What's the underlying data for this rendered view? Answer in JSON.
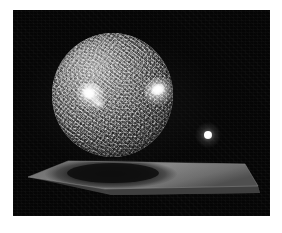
{
  "page": {
    "background_color": "#ffffff",
    "width": 282,
    "height": 233
  },
  "render": {
    "frame": {
      "x": 13,
      "y": 10,
      "width": 257,
      "height": 206,
      "background_color": "#050505"
    },
    "objects": {
      "main_sphere": {
        "name": "textured sphere",
        "center_x": 112,
        "center_y": 95,
        "diameter": 121,
        "base_color": "#8f8f8f",
        "highlight_color": "#ffffff",
        "shadow_color": "#2a2a2a",
        "surface": "mottled granular grayscale"
      },
      "specular_highlights": [
        {
          "id": "left",
          "center_x": 85,
          "center_y": 93,
          "width": 30,
          "height": 26,
          "color": "#ffffff"
        },
        {
          "id": "right",
          "center_x": 156,
          "center_y": 91,
          "width": 30,
          "height": 28,
          "color": "#ffffff"
        }
      ],
      "light_sphere": {
        "name": "point light sphere",
        "center_x": 208,
        "center_y": 135,
        "diameter": 8,
        "color": "#ffffff"
      },
      "platform": {
        "name": "ground slab",
        "top_color": "#6f6f6f",
        "edge_color": "#4a4a4a",
        "front_color": "#3a3a3a",
        "left_tip_x": 28,
        "left_tip_y": 167,
        "right_tip_x": 258,
        "right_tip_y": 176,
        "thickness": 7
      },
      "cast_shadow": {
        "name": "elliptical cast shadow",
        "center_x": 112,
        "center_y": 164,
        "width": 130,
        "height": 30,
        "color": "#1a1a1a"
      }
    }
  },
  "caption": {
    "title": "Rendered scene: textured sphere on a slab",
    "alt_text": "A large gray mottled sphere with two bright specular highlights rests on a flat gray rectangular slab seen in perspective, casting a dark elliptical shadow. A small white glowing sphere representing the light source floats to the right against a black background."
  }
}
